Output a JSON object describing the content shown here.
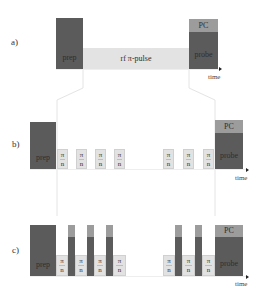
{
  "panels": [
    {
      "label": "a)",
      "prep_label": "prep",
      "rf_label": "rf π-pulse",
      "pc_label": "PC",
      "probe_label": "probe",
      "time_label": "time"
    },
    {
      "label": "b)",
      "prep_label": "prep",
      "pulse_numerator": "π",
      "pulse_denominator": "n",
      "pc_label": "PC",
      "probe_label": "probe",
      "time_label": "time",
      "pulse_count_visible": 7
    },
    {
      "label": "c)",
      "prep_label": "prep",
      "pulse_numerator": "π",
      "pulse_denominator": "n",
      "pc_label": "PC",
      "probe_label": "probe",
      "time_label": "time",
      "pulse_count_visible": 7,
      "interleaved_probe_count": 5
    }
  ],
  "colors": {
    "dark": "#5b5b5b",
    "mid": "#9c9c9c",
    "light": "#e3e3e3"
  }
}
